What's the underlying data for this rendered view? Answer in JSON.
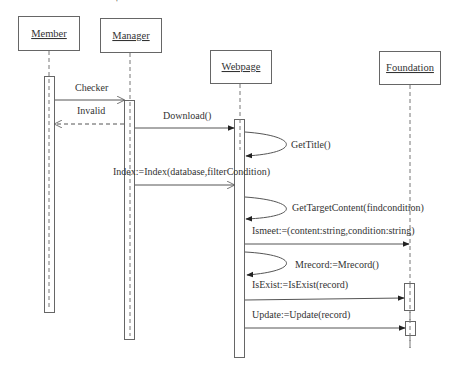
{
  "diagram": {
    "type": "sequence",
    "participants": [
      {
        "id": "member",
        "label": "Member"
      },
      {
        "id": "manager",
        "label": "Manager"
      },
      {
        "id": "webpage",
        "label": "Webpage"
      },
      {
        "id": "foundation",
        "label": "Foundation"
      }
    ],
    "messages": [
      {
        "from": "member",
        "to": "manager",
        "label": "Checker",
        "style": "sync-open"
      },
      {
        "from": "manager",
        "to": "member",
        "label": "Invalid",
        "style": "return-dashed"
      },
      {
        "from": "manager",
        "to": "webpage",
        "label": "Download()",
        "style": "sync-filled"
      },
      {
        "from": "webpage",
        "to": "webpage",
        "label": "GetTitle()",
        "style": "self"
      },
      {
        "from": "manager",
        "to": "webpage",
        "label": "Index:=Index(database,filterCondition)",
        "style": "sync-open"
      },
      {
        "from": "webpage",
        "to": "webpage",
        "label": "GetTargetContent(findcondition)",
        "style": "self"
      },
      {
        "from": "webpage",
        "to": "foundation",
        "label": "Ismeet:=(content:string,condition:string)",
        "style": "sync-filled"
      },
      {
        "from": "webpage",
        "to": "webpage",
        "label": "Mrecord:=Mrecord()",
        "style": "self"
      },
      {
        "from": "webpage",
        "to": "foundation",
        "label": "IsExist:=IsExist(record)",
        "style": "sync-filled"
      },
      {
        "from": "webpage",
        "to": "foundation",
        "label": "Update:=Update(record)",
        "style": "sync-filled"
      }
    ]
  }
}
